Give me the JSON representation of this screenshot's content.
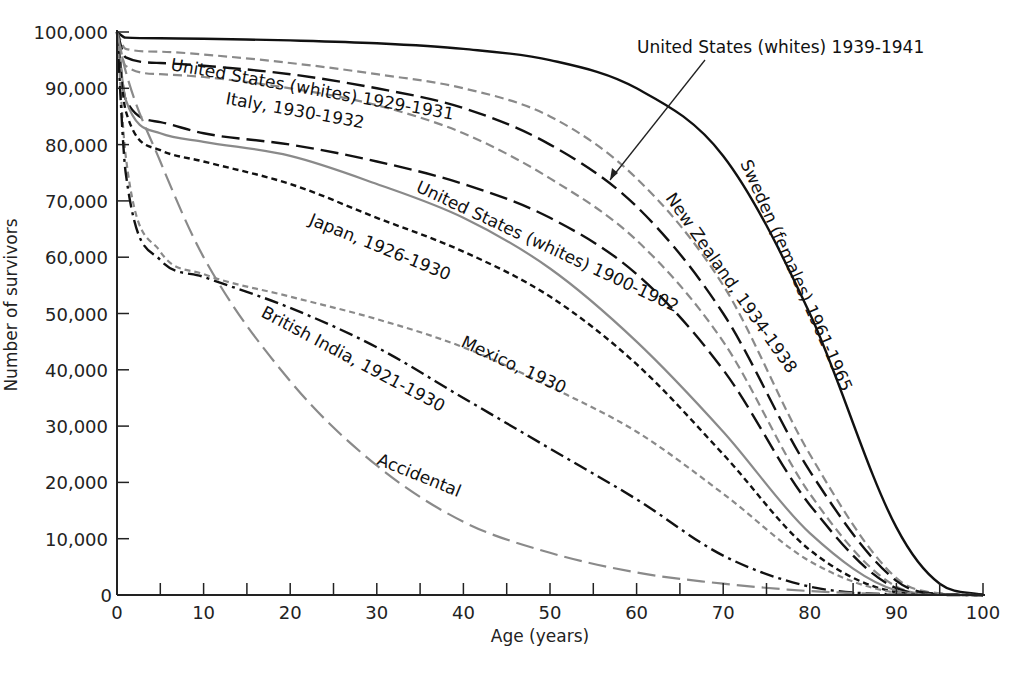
{
  "chart_data": {
    "type": "line",
    "title": "",
    "xlabel": "Age (years)",
    "ylabel": "Number of survivors",
    "xlim": [
      0,
      100
    ],
    "ylim": [
      0,
      100000
    ],
    "xticks": [
      0,
      10,
      20,
      30,
      40,
      50,
      60,
      70,
      80,
      90,
      100
    ],
    "xtick_labels": [
      "0",
      "10",
      "20",
      "30",
      "40",
      "50",
      "60",
      "70",
      "80",
      "90",
      "100"
    ],
    "yticks": [
      0,
      10000,
      20000,
      30000,
      40000,
      50000,
      60000,
      70000,
      80000,
      90000,
      100000
    ],
    "ytick_labels": [
      "0",
      "10,000",
      "20,000",
      "30,000",
      "40,000",
      "50,000",
      "60,000",
      "70,000",
      "80,000",
      "90,000",
      "100,000"
    ],
    "grid": false,
    "legend": "none (curves labeled directly)",
    "x": [
      0,
      1,
      5,
      10,
      20,
      30,
      40,
      50,
      60,
      70,
      80,
      90,
      95,
      100
    ],
    "series": [
      {
        "name": "Sweden (females) 1961-1965",
        "color": "#111111",
        "style": "solid",
        "values": [
          100000,
          99000,
          98900,
          98800,
          98500,
          98000,
          97000,
          95000,
          90000,
          78000,
          50000,
          12000,
          2000,
          0
        ]
      },
      {
        "name": "New Zealand, 1934-1938",
        "color": "#8a8a8a",
        "style": "dashed",
        "values": [
          100000,
          97000,
          96500,
          96000,
          94500,
          92500,
          90000,
          85000,
          74000,
          55000,
          25000,
          3000,
          300,
          0
        ]
      },
      {
        "name": "United States (whites) 1939-1941",
        "color": "#111111",
        "style": "long-dash",
        "values": [
          100000,
          95500,
          94500,
          94000,
          92500,
          90000,
          86500,
          80000,
          69000,
          50000,
          22000,
          2500,
          200,
          0
        ]
      },
      {
        "name": "United States (whites) 1929-1931",
        "color": "#8a8a8a",
        "style": "dashed",
        "values": [
          100000,
          94000,
          92500,
          92000,
          90000,
          87000,
          82000,
          74000,
          63000,
          45000,
          18000,
          1500,
          100,
          0
        ]
      },
      {
        "name": "Italy, 1930-1932",
        "color": "#111111",
        "style": "long-dash",
        "values": [
          100000,
          88000,
          84000,
          82000,
          80000,
          77000,
          73000,
          67000,
          57000,
          40000,
          16000,
          1200,
          100,
          0
        ]
      },
      {
        "name": "United States (whites) 1900-1902",
        "color": "#8a8a8a",
        "style": "solid",
        "values": [
          100000,
          88000,
          82000,
          80500,
          78000,
          73000,
          67000,
          58000,
          45000,
          29000,
          11000,
          800,
          50,
          0
        ]
      },
      {
        "name": "Japan, 1926-1930",
        "color": "#111111",
        "style": "short-dash",
        "values": [
          100000,
          86000,
          79000,
          77000,
          73000,
          67000,
          61000,
          53000,
          41000,
          25000,
          8000,
          500,
          50,
          0
        ]
      },
      {
        "name": "Mexico, 1930",
        "color": "#8a8a8a",
        "style": "short-dash",
        "values": [
          100000,
          78000,
          61000,
          57000,
          53000,
          49000,
          44000,
          37000,
          29000,
          18000,
          6000,
          400,
          30,
          0
        ]
      },
      {
        "name": "British India, 1921-1930",
        "color": "#111111",
        "style": "dash-dot",
        "values": [
          100000,
          75000,
          59500,
          56500,
          51000,
          44000,
          35000,
          26000,
          17000,
          7000,
          1500,
          100,
          10,
          0
        ]
      },
      {
        "name": "Accidental",
        "color": "#8a8a8a",
        "style": "long-dash",
        "values": [
          100000,
          93000,
          77000,
          60000,
          38000,
          23000,
          13000,
          7500,
          4000,
          2000,
          700,
          100,
          10,
          0
        ]
      }
    ],
    "annotations": [
      {
        "text": "United States (whites) 1939-1941",
        "arrow_to_series": "United States (whites) 1939-1941",
        "arrow_at_age": 57
      }
    ]
  },
  "labels": {
    "us_1939": "United States (whites) 1939-1941",
    "sweden": "Sweden (females) 1961-1965",
    "new_zealand": "New Zealand, 1934-1938",
    "us_1929": "United States (whites) 1929-1931",
    "italy": "Italy, 1930-1932",
    "us_1900": "United States (whites) 1900-1902",
    "japan": "Japan, 1926-1930",
    "mexico": "Mexico, 1930",
    "british_india": "British India, 1921-1930",
    "accidental": "Accidental"
  },
  "axes": {
    "xlabel": "Age (years)",
    "ylabel": "Number of survivors"
  }
}
